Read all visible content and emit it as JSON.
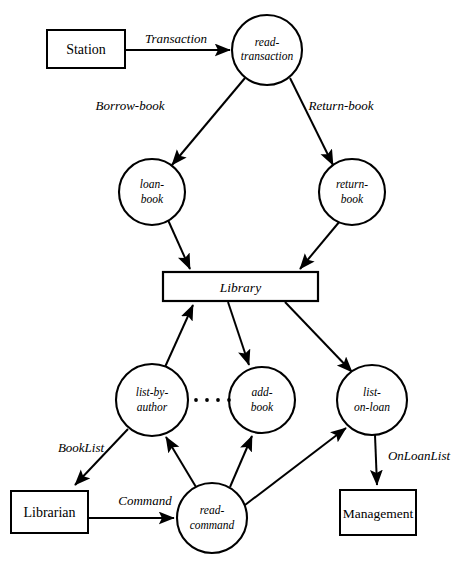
{
  "diagram": {
    "type": "data-flow-diagram",
    "background_color": "#ffffff",
    "stroke_color": "#000000",
    "processes": [
      {
        "id": "read-transaction",
        "line1": "read-",
        "line2": "transaction",
        "cx": 267,
        "cy": 50,
        "r": 35
      },
      {
        "id": "loan-book",
        "line1": "loan-",
        "line2": "book",
        "cx": 152,
        "cy": 192,
        "r": 33
      },
      {
        "id": "return-book",
        "line1": "return-",
        "line2": "book",
        "cx": 352,
        "cy": 192,
        "r": 33
      },
      {
        "id": "list-by-author",
        "line1": "list-by-",
        "line2": "author",
        "cx": 152,
        "cy": 400,
        "r": 36
      },
      {
        "id": "add-book",
        "line1": "add-",
        "line2": "book",
        "cx": 262,
        "cy": 400,
        "r": 33
      },
      {
        "id": "list-on-loan",
        "line1": "list-",
        "line2": "on-loan",
        "cx": 372,
        "cy": 400,
        "r": 35
      },
      {
        "id": "read-command",
        "line1": "read-",
        "line2": "command",
        "cx": 212,
        "cy": 518,
        "r": 35
      }
    ],
    "data_stores": [
      {
        "id": "library",
        "label": "Library",
        "x": 163,
        "y": 272,
        "width": 155,
        "height": 29
      }
    ],
    "external_entities": [
      {
        "id": "station",
        "label": "Station",
        "x": 47,
        "y": 30,
        "width": 78,
        "height": 38
      },
      {
        "id": "librarian",
        "label": "Librarian",
        "x": 11,
        "y": 491,
        "width": 77,
        "height": 42
      },
      {
        "id": "management",
        "label": "Management",
        "x": 340,
        "y": 490,
        "width": 76,
        "height": 45
      }
    ],
    "flow_labels": [
      {
        "id": "transaction",
        "label": "Transaction",
        "x": 176,
        "y": 43
      },
      {
        "id": "borrow-book",
        "label": "Borrow-book",
        "x": 130,
        "y": 110
      },
      {
        "id": "return-book-flow",
        "label": "Return-book",
        "x": 341,
        "y": 110
      },
      {
        "id": "booklist",
        "label": "BookList",
        "x": 81,
        "y": 452
      },
      {
        "id": "command",
        "label": "Command",
        "x": 145,
        "y": 505
      },
      {
        "id": "onloanlist",
        "label": "OnLoanList",
        "x": 419,
        "y": 460
      }
    ],
    "ellipsis": {
      "id": "process-ellipsis",
      "dots": 4,
      "cx_start": 196,
      "cy": 400,
      "spacing": 11,
      "r": 1.9
    }
  }
}
